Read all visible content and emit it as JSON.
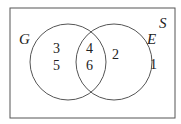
{
  "diagram": {
    "type": "venn",
    "universal_set": {
      "label": "S",
      "elements_outside": [
        "1"
      ]
    },
    "sets": [
      {
        "label": "G",
        "only": [
          "3",
          "5"
        ]
      },
      {
        "label": "E",
        "only": [
          "2"
        ]
      }
    ],
    "intersection": [
      "4",
      "6"
    ],
    "colors": {
      "stroke": "#555555",
      "text": "#222222",
      "background": "#ffffff"
    }
  }
}
